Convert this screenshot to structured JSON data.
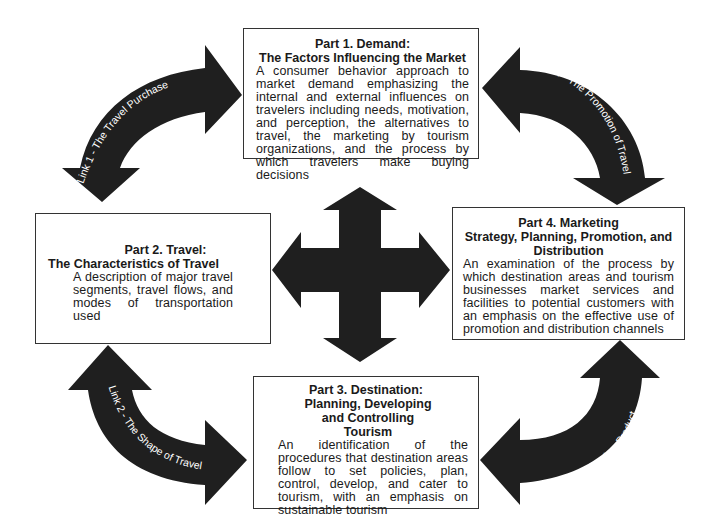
{
  "diagram": {
    "type": "cycle-framework",
    "colors": {
      "arrow_fill": "#1f1f1f",
      "box_border": "#333333",
      "link_text": "#ffffff",
      "background": "#ffffff"
    },
    "parts": [
      {
        "id": "part1",
        "title": "Part 1. Demand:",
        "subtitle": "The Factors Influencing the Market",
        "description": "A consumer behavior approach to market demand emphasizing the internal and external influences on travelers including needs, motivation, and perception, the alternatives to travel, the marketing by tourism organizations, and the process by which travelers make buying decisions"
      },
      {
        "id": "part2",
        "title": "Part 2. Travel:",
        "subtitle": "The Characteristics of Travel",
        "description": "A description of major travel segments, travel flows, and modes of transportation used"
      },
      {
        "id": "part3",
        "title": "Part 3. Destination:",
        "subtitle": "Planning, Developing and Controlling Tourism",
        "description": "An identification of the procedures that destination areas follow to set policies, plan, control, develop, and cater to tourism, with an emphasis on sustainable tourism"
      },
      {
        "id": "part4",
        "title": "Part 4. Marketing",
        "subtitle": "Strategy, Planning, Promotion, and Distribution",
        "description": "An examination of the process by which destination areas and tourism businesses market services and facilities to potential customers with an emphasis on the effective use of promotion and distribution channels"
      }
    ],
    "links": [
      {
        "id": "link1",
        "label": "Link 1 - The Travel Purchase",
        "connects": [
          "Part 2",
          "Part 1"
        ]
      },
      {
        "id": "link2",
        "label": "Link 2 - The Shape of Travel",
        "connects": [
          "Part 2",
          "Part 3"
        ]
      },
      {
        "id": "link3",
        "label": "Link 3 - The Tourism Product",
        "connects": [
          "Part 3",
          "Part 4"
        ]
      },
      {
        "id": "link4",
        "label": "Link 4 - The Promotion of Travel",
        "connects": [
          "Part 1",
          "Part 4"
        ]
      }
    ],
    "center_icon": "four-way-arrow-icon"
  }
}
